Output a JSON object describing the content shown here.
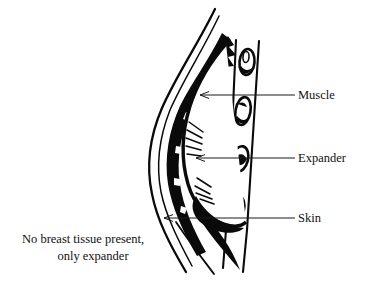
{
  "figure": {
    "type": "medical-line-illustration",
    "background_color": "#ffffff",
    "ink_color": "#000000"
  },
  "annotations": [
    {
      "id": "muscle",
      "label": "Muscle",
      "leader_line": {
        "x1": 200,
        "y1": 95,
        "x2": 295,
        "y2": 95,
        "arrow_end": "left"
      }
    },
    {
      "id": "expander",
      "label": "Expander",
      "leader_line": {
        "x1": 196,
        "y1": 158,
        "x2": 295,
        "y2": 158,
        "arrow_end": "left"
      }
    },
    {
      "id": "skin",
      "label": "Skin",
      "leader_line": {
        "x1": 164,
        "y1": 218,
        "x2": 295,
        "y2": 218,
        "arrow_end": "left"
      }
    }
  ],
  "caption": {
    "line_1": "No breast tissue present,",
    "line_2": "only expander"
  },
  "anatomy": {
    "skin_layer": "Outer contour line running from upper right, curving around the mound to the lower right",
    "muscle_layer": "Thick dark band beneath the skin, jagged along the upper slope",
    "expander_body": "Large rounded white mass filling the mound, outlined in heavy black",
    "chest_wall": "Vertical double-line column on the right side",
    "rib_count": 4,
    "ribs": [
      {
        "index": 1,
        "cx": 247,
        "cy": 62
      },
      {
        "index": 2,
        "cx": 243,
        "cy": 110
      },
      {
        "index": 3,
        "cx": 240,
        "cy": 160
      },
      {
        "index": 4,
        "cx": 236,
        "cy": 210
      }
    ]
  }
}
